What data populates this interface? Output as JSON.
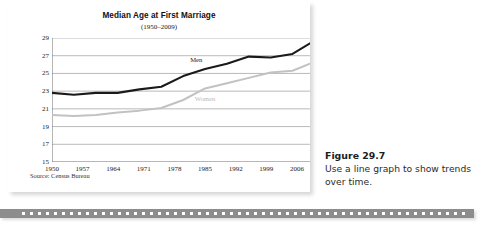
{
  "chart_data": {
    "type": "line",
    "title": "Median Age at First Marriage",
    "subtitle": "(1950–2009)",
    "xlabel": "",
    "ylabel": "",
    "xlim": [
      1950,
      2009
    ],
    "ylim": [
      15,
      29
    ],
    "yticks": [
      29,
      27,
      25,
      23,
      21,
      19,
      17,
      15
    ],
    "xticks": [
      1950,
      1957,
      1964,
      1971,
      1978,
      1985,
      1992,
      1999,
      2006
    ],
    "grid": "horizontal",
    "legend_position": "inline-labels",
    "source": "Source: Census Bureau",
    "x": [
      1950,
      1955,
      1960,
      1965,
      1970,
      1975,
      1980,
      1985,
      1990,
      1995,
      2000,
      2005,
      2009
    ],
    "series": [
      {
        "name": "Men",
        "color": "#1a1a1a",
        "values": [
          22.8,
          22.6,
          22.8,
          22.8,
          23.2,
          23.5,
          24.7,
          25.5,
          26.1,
          26.9,
          26.8,
          27.2,
          28.4
        ],
        "label_x": 1983,
        "label_y": 26.6
      },
      {
        "name": "Women",
        "color": "#c2c2c2",
        "values": [
          20.3,
          20.2,
          20.3,
          20.6,
          20.8,
          21.1,
          22.0,
          23.3,
          23.9,
          24.5,
          25.1,
          25.3,
          26.1
        ],
        "label_x": 1985,
        "label_y": 22.2
      }
    ]
  },
  "caption": {
    "figure_number": "Figure 29.7",
    "text": "Use a line graph to show trends over time."
  }
}
